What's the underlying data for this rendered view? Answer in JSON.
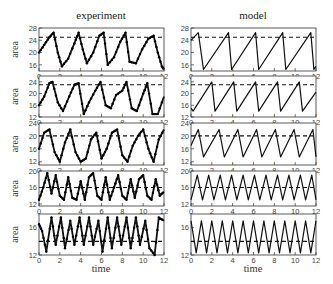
{
  "figure": {
    "columns": [
      {
        "title": "experiment"
      },
      {
        "title": "model"
      }
    ],
    "xlabel": "time",
    "ylabel": "area"
  },
  "chart_data": [
    {
      "panel": "experiment-row1",
      "type": "line",
      "style": "dotted-markers",
      "xlim": [
        0,
        12
      ],
      "ylim": [
        14,
        28
      ],
      "yticks": [
        16,
        20,
        24,
        28
      ],
      "xticks": [
        0,
        2,
        4,
        6,
        8,
        10,
        12
      ],
      "threshold": 25,
      "x": [
        0,
        0.5,
        1.0,
        1.4,
        1.8,
        2.2,
        2.8,
        3.4,
        3.8,
        4.2,
        4.6,
        5.2,
        5.8,
        6.2,
        6.6,
        7.2,
        7.8,
        8.3,
        8.7,
        9.3,
        9.9,
        10.5,
        11.0,
        11.4,
        11.8,
        12
      ],
      "y": [
        20,
        22.5,
        25,
        26.5,
        20,
        15.5,
        18,
        23,
        26.5,
        21,
        16.5,
        20,
        25.5,
        26.5,
        16,
        18.5,
        23.5,
        26.5,
        17,
        16.5,
        21,
        24.5,
        25.5,
        20,
        15.5,
        14.5
      ]
    },
    {
      "panel": "model-row1",
      "type": "line",
      "xlim": [
        0,
        12
      ],
      "ylim": [
        14,
        28
      ],
      "yticks": [
        16,
        20,
        24,
        28
      ],
      "xticks": [
        0,
        2,
        4,
        6,
        8,
        10,
        12
      ],
      "threshold": 25,
      "x": [
        0,
        0.7,
        1.2,
        3.6,
        3.9,
        6.2,
        6.5,
        8.8,
        9.1,
        11.5,
        11.8,
        12
      ],
      "y": [
        24,
        26.5,
        14.5,
        26.5,
        14.5,
        26.5,
        14.5,
        26.5,
        14.5,
        26.5,
        14.5,
        15.5
      ]
    },
    {
      "panel": "experiment-row2",
      "type": "line",
      "style": "dotted-markers",
      "xlim": [
        0,
        12
      ],
      "ylim": [
        12,
        26
      ],
      "yticks": [
        12,
        16,
        20,
        24
      ],
      "xticks": [
        0,
        2,
        4,
        6,
        8,
        10,
        12
      ],
      "threshold": 23,
      "x": [
        0,
        0.5,
        1.0,
        1.3,
        1.8,
        2.3,
        2.9,
        3.4,
        3.8,
        4.3,
        4.8,
        5.4,
        5.9,
        6.4,
        6.9,
        7.4,
        8.0,
        8.4,
        8.9,
        9.4,
        10.0,
        10.4,
        10.9,
        11.4,
        12
      ],
      "y": [
        16,
        19,
        23.5,
        24,
        17,
        14,
        19,
        23,
        23.5,
        13,
        17,
        21,
        24,
        16,
        15,
        19.5,
        21,
        24,
        15,
        14,
        20,
        23.5,
        13,
        13,
        19
      ]
    },
    {
      "panel": "model-row2",
      "type": "line",
      "xlim": [
        0,
        12
      ],
      "ylim": [
        12,
        26
      ],
      "yticks": [
        12,
        16,
        20,
        24
      ],
      "xticks": [
        0,
        2,
        4,
        6,
        8,
        10,
        12
      ],
      "threshold": 23,
      "x": [
        0,
        0.2,
        2.0,
        2.3,
        4.1,
        4.4,
        6.2,
        6.5,
        8.3,
        8.6,
        10.4,
        10.7,
        12
      ],
      "y": [
        15,
        14,
        24,
        14,
        24,
        14,
        24,
        14,
        24,
        14,
        24,
        14,
        20.5
      ]
    },
    {
      "panel": "experiment-row3",
      "type": "line",
      "style": "dotted-markers",
      "xlim": [
        0,
        12
      ],
      "ylim": [
        11,
        24
      ],
      "yticks": [
        12,
        16,
        20,
        24
      ],
      "xticks": [
        0,
        2,
        4,
        6,
        8,
        10,
        12
      ],
      "threshold": 20,
      "x": [
        0,
        0.5,
        1.0,
        1.5,
        2.0,
        2.5,
        3.0,
        3.5,
        4.0,
        4.5,
        5.0,
        5.5,
        6.0,
        6.5,
        7.0,
        7.5,
        8.0,
        8.5,
        9.0,
        9.5,
        10.0,
        10.5,
        11.0,
        11.5,
        12
      ],
      "y": [
        16,
        21,
        22,
        15,
        12,
        18,
        22,
        15,
        12,
        13,
        19,
        21,
        13,
        16,
        21,
        22,
        14,
        12,
        17,
        20,
        22,
        16,
        12,
        19,
        22
      ]
    },
    {
      "panel": "model-row3",
      "type": "line",
      "xlim": [
        0,
        12
      ],
      "ylim": [
        11,
        24
      ],
      "yticks": [
        12,
        16,
        20,
        24
      ],
      "xticks": [
        0,
        2,
        4,
        6,
        8,
        10,
        12
      ],
      "threshold": 20,
      "x": [
        0,
        0.7,
        1.2,
        2.7,
        3.2,
        4.5,
        5.0,
        6.3,
        6.8,
        8.1,
        8.6,
        9.9,
        10.4,
        11.7,
        12
      ],
      "y": [
        17,
        22,
        13.5,
        22,
        13.5,
        22,
        13.5,
        22,
        13.5,
        22,
        13.5,
        22,
        13.5,
        22,
        13.5
      ]
    },
    {
      "panel": "experiment-row4",
      "type": "line",
      "style": "dotted-markers",
      "xlim": [
        0,
        12
      ],
      "ylim": [
        11.5,
        20
      ],
      "yticks": [
        12,
        16,
        20
      ],
      "xticks": [
        0,
        2,
        4,
        6,
        8,
        10,
        12
      ],
      "threshold": 16,
      "x": [
        0,
        0.4,
        0.8,
        1.2,
        1.6,
        2.0,
        2.4,
        2.8,
        3.2,
        3.6,
        4.0,
        4.4,
        4.8,
        5.2,
        5.6,
        6.0,
        6.4,
        6.8,
        7.2,
        7.6,
        8.0,
        8.4,
        8.8,
        9.2,
        9.6,
        10.0,
        10.4,
        10.8,
        11.2,
        11.6,
        12
      ],
      "y": [
        13,
        16,
        19.5,
        14.5,
        19,
        14,
        13,
        18.5,
        13.5,
        13,
        17.5,
        13,
        18.5,
        19.5,
        14,
        13,
        18.5,
        13,
        16,
        19,
        14,
        13,
        18,
        13.5,
        18,
        19,
        14,
        13,
        18,
        14,
        15
      ]
    },
    {
      "panel": "model-row4",
      "type": "line",
      "xlim": [
        0,
        12
      ],
      "ylim": [
        11.5,
        20
      ],
      "yticks": [
        12,
        16,
        20
      ],
      "xticks": [
        0,
        2,
        4,
        6,
        8,
        10,
        12
      ],
      "threshold": 16,
      "x": [
        0,
        0.6,
        1.1,
        1.7,
        2.2,
        2.8,
        3.3,
        3.9,
        4.4,
        5.0,
        5.5,
        6.1,
        6.6,
        7.2,
        7.7,
        8.3,
        8.8,
        9.4,
        9.9,
        10.5,
        11.0,
        11.6,
        12
      ],
      "y": [
        13,
        19,
        13,
        19,
        13,
        19,
        13,
        19,
        13,
        19,
        13,
        19,
        13,
        19,
        13,
        19,
        13,
        19,
        13,
        19,
        13,
        19,
        13
      ]
    },
    {
      "panel": "experiment-row5",
      "type": "line",
      "style": "dotted-markers",
      "xlim": [
        0,
        12
      ],
      "ylim": [
        12,
        18
      ],
      "yticks": [
        12,
        16
      ],
      "xticks": [
        0,
        2,
        4,
        6,
        8,
        10,
        12
      ],
      "threshold": 14,
      "x": [
        0,
        0.3,
        0.7,
        1.2,
        1.6,
        2.1,
        2.5,
        3.0,
        3.4,
        3.9,
        4.3,
        4.8,
        5.2,
        5.7,
        6.1,
        6.6,
        7.0,
        7.5,
        7.9,
        8.4,
        8.8,
        9.3,
        9.7,
        10.2,
        10.6,
        11.1,
        11.5,
        12
      ],
      "y": [
        16.5,
        15.5,
        12.5,
        17.5,
        13.5,
        17.5,
        13,
        17,
        13.5,
        17.5,
        13.5,
        17.5,
        13.5,
        17,
        12.5,
        17.5,
        13,
        17.5,
        13.5,
        17.5,
        13,
        17.5,
        13.5,
        17,
        13,
        12,
        17.5,
        17
      ]
    },
    {
      "panel": "model-row5",
      "type": "line",
      "xlim": [
        0,
        12
      ],
      "ylim": [
        12,
        18
      ],
      "yticks": [
        12,
        16
      ],
      "xticks": [
        0,
        2,
        4,
        6,
        8,
        10,
        12
      ],
      "threshold": 14,
      "x": [
        0,
        0.5,
        1.0,
        1.5,
        2.0,
        2.5,
        3.0,
        3.5,
        4.0,
        4.5,
        5.0,
        5.5,
        6.0,
        6.5,
        7.0,
        7.5,
        8.0,
        8.5,
        9.0,
        9.5,
        10.0,
        10.5,
        11.0,
        11.5,
        12
      ],
      "y": [
        17,
        12.3,
        17,
        12.3,
        17,
        12.3,
        17,
        12.3,
        17,
        12.3,
        17,
        12.3,
        17,
        12.3,
        17,
        12.3,
        17,
        12.3,
        17,
        12.3,
        17,
        12.3,
        17,
        12.3,
        17
      ]
    }
  ]
}
